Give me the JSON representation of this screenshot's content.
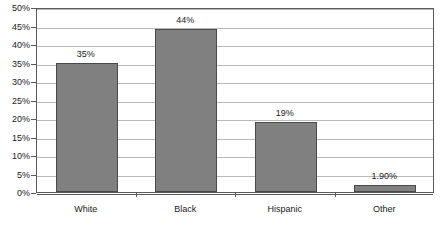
{
  "chart_data": {
    "type": "bar",
    "title": "",
    "xlabel": "",
    "ylabel": "",
    "categories": [
      "White",
      "Black",
      "Hispanic",
      "Other"
    ],
    "values": [
      35,
      44,
      19,
      1.9
    ],
    "value_labels": [
      "35%",
      "44%",
      "19%",
      "1.90%"
    ],
    "ylim": [
      0,
      50
    ],
    "ytick_values": [
      0,
      5,
      10,
      15,
      20,
      25,
      30,
      35,
      40,
      45,
      50
    ],
    "ytick_labels": [
      "0%",
      "5%",
      "10%",
      "15%",
      "20%",
      "25%",
      "30%",
      "35%",
      "40%",
      "45%",
      "50%"
    ],
    "grid": true,
    "legend": false,
    "series": [
      {
        "name": "",
        "values": [
          35,
          44,
          19,
          1.9
        ]
      }
    ],
    "colors": {
      "bar_fill": "#808080",
      "bar_border": "#4a4a4a",
      "gridline": "#b8b8b8",
      "axis": "#5a5a5a",
      "text": "#1a1a1a",
      "background": "#ffffff"
    }
  }
}
